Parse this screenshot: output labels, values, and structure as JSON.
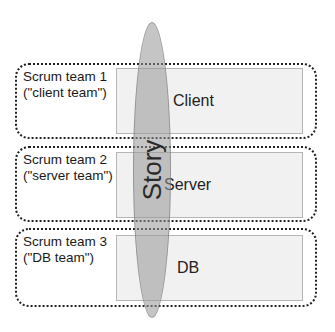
{
  "diagram": {
    "teams": [
      {
        "label_line1": "Scrum team 1",
        "label_line2": "(\"client team\")",
        "component": "Client"
      },
      {
        "label_line1": "Scrum team 2",
        "label_line2": "(\"server team\")",
        "component": "Server"
      },
      {
        "label_line1": "Scrum team 3",
        "label_line2": "(\"DB team\")",
        "component": "DB"
      }
    ],
    "story_label": "Story"
  }
}
